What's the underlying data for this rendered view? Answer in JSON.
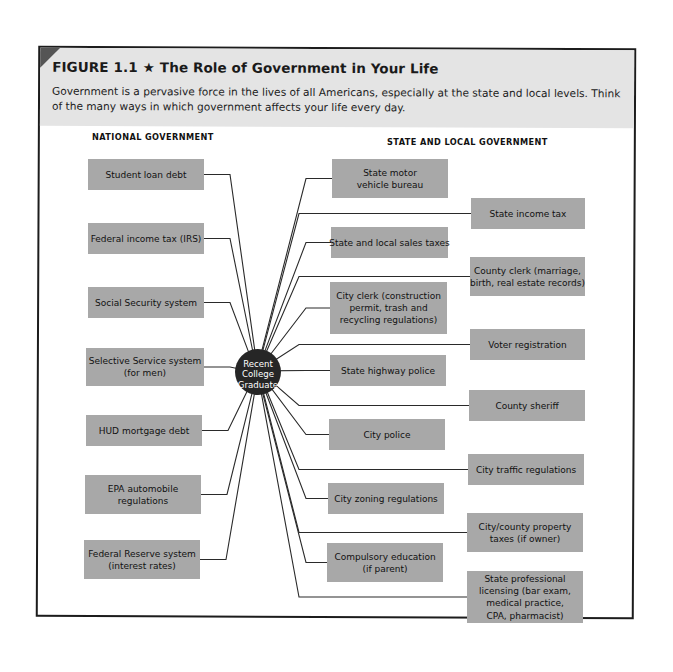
{
  "figure": {
    "number_label": "FIGURE 1.1",
    "star": "★",
    "title": "The Role of Government in Your Life",
    "caption": "Government is a pervasive force in the lives of all Americans, especially at the state and local levels. Think of the many ways in which government affects your life every day."
  },
  "hub": {
    "label_lines": [
      "Recent",
      "College",
      "Graduate"
    ],
    "color": "#262626",
    "cx": 258,
    "cy": 372,
    "r": 23
  },
  "colors": {
    "header_band": "#e4e4e4",
    "box_fill": "#a8a8a8",
    "corner_tab": "#555555",
    "line": "#2a2a2a"
  },
  "national": {
    "heading": "NATIONAL GOVERNMENT",
    "heading_pos": [
      92,
      140
    ],
    "items": [
      {
        "lines": [
          "Student loan debt"
        ],
        "x": 88,
        "y": 159,
        "w": 116,
        "h": 31
      },
      {
        "lines": [
          "Federal income tax (IRS)"
        ],
        "x": 88,
        "y": 223,
        "w": 116,
        "h": 31
      },
      {
        "lines": [
          "Social Security system"
        ],
        "x": 88,
        "y": 287,
        "w": 116,
        "h": 31
      },
      {
        "lines": [
          "Selective Service system",
          "(for men)"
        ],
        "x": 86,
        "y": 348,
        "w": 118,
        "h": 38
      },
      {
        "lines": [
          "HUD mortgage debt"
        ],
        "x": 86,
        "y": 415,
        "w": 116,
        "h": 31
      },
      {
        "lines": [
          "EPA automobile",
          "regulations"
        ],
        "x": 85,
        "y": 475,
        "w": 116,
        "h": 39
      },
      {
        "lines": [
          "Federal Reserve system",
          "(interest rates)"
        ],
        "x": 84,
        "y": 540,
        "w": 116,
        "h": 39
      }
    ]
  },
  "state_local": {
    "heading": "STATE AND LOCAL GOVERNMENT",
    "heading_pos": [
      387,
      145
    ],
    "items": [
      {
        "lines": [
          "State motor",
          "vehicle bureau"
        ],
        "x": 332,
        "y": 159,
        "w": 116,
        "h": 39,
        "col": "inner"
      },
      {
        "lines": [
          "State income tax"
        ],
        "x": 471,
        "y": 198,
        "w": 114,
        "h": 31,
        "col": "outer"
      },
      {
        "lines": [
          "State and local sales taxes"
        ],
        "x": 331,
        "y": 227,
        "w": 117,
        "h": 31,
        "col": "inner"
      },
      {
        "lines": [
          "County clerk (marriage,",
          "birth, real estate records)"
        ],
        "x": 470,
        "y": 257,
        "w": 115,
        "h": 39,
        "col": "outer"
      },
      {
        "lines": [
          "City clerk (construction",
          "permit, trash and",
          "recycling regulations)"
        ],
        "x": 330,
        "y": 282,
        "w": 117,
        "h": 52,
        "col": "inner"
      },
      {
        "lines": [
          "Voter registration"
        ],
        "x": 470,
        "y": 329,
        "w": 115,
        "h": 31,
        "col": "outer"
      },
      {
        "lines": [
          "State highway police"
        ],
        "x": 330,
        "y": 355,
        "w": 116,
        "h": 31,
        "col": "inner"
      },
      {
        "lines": [
          "County sheriff"
        ],
        "x": 469,
        "y": 390,
        "w": 116,
        "h": 31,
        "col": "outer"
      },
      {
        "lines": [
          "City police"
        ],
        "x": 329,
        "y": 419,
        "w": 116,
        "h": 31,
        "col": "inner"
      },
      {
        "lines": [
          "City traffic regulations"
        ],
        "x": 468,
        "y": 454,
        "w": 116,
        "h": 31,
        "col": "outer"
      },
      {
        "lines": [
          "City zoning regulations"
        ],
        "x": 328,
        "y": 483,
        "w": 116,
        "h": 31,
        "col": "inner"
      },
      {
        "lines": [
          "City/county property",
          "taxes (if owner)"
        ],
        "x": 467,
        "y": 513,
        "w": 116,
        "h": 39,
        "col": "outer"
      },
      {
        "lines": [
          "Compulsory education",
          "(if parent)"
        ],
        "x": 327,
        "y": 543,
        "w": 116,
        "h": 39,
        "col": "inner"
      },
      {
        "lines": [
          "State professional",
          "licensing (bar exam,",
          "medical practice,",
          "CPA, pharmacist)"
        ],
        "x": 467,
        "y": 571,
        "w": 116,
        "h": 52,
        "col": "outer"
      }
    ]
  }
}
